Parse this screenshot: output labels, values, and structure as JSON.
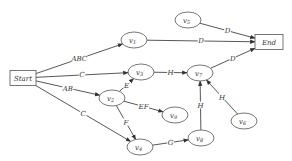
{
  "diagram": {
    "type": "directed-graph",
    "colors": {
      "stroke": "#444444",
      "fill": "#ffffff",
      "text": "#333333"
    },
    "nodes": [
      {
        "id": "start",
        "label": "Start",
        "shape": "rect",
        "x": 23,
        "y": 78,
        "w": 26,
        "h": 15
      },
      {
        "id": "end",
        "label": "End",
        "shape": "rect",
        "x": 269,
        "y": 42,
        "w": 28,
        "h": 15
      },
      {
        "id": "v1",
        "label": "v",
        "sub": "1",
        "shape": "ellipse",
        "x": 134,
        "y": 40
      },
      {
        "id": "v2",
        "label": "v",
        "sub": "2",
        "shape": "ellipse",
        "x": 112,
        "y": 98
      },
      {
        "id": "v3",
        "label": "v",
        "sub": "3",
        "shape": "ellipse",
        "x": 141,
        "y": 72
      },
      {
        "id": "v4",
        "label": "v",
        "sub": "4",
        "shape": "ellipse",
        "x": 140,
        "y": 147
      },
      {
        "id": "v5",
        "label": "v",
        "sub": "5",
        "shape": "ellipse",
        "x": 188,
        "y": 20
      },
      {
        "id": "v6",
        "label": "v",
        "sub": "6",
        "shape": "ellipse",
        "x": 244,
        "y": 121
      },
      {
        "id": "v7",
        "label": "v",
        "sub": "7",
        "shape": "ellipse",
        "x": 200,
        "y": 73
      },
      {
        "id": "v8",
        "label": "v",
        "sub": "8",
        "shape": "ellipse",
        "x": 201,
        "y": 138
      },
      {
        "id": "v9",
        "label": "v",
        "sub": "9",
        "shape": "ellipse",
        "x": 175,
        "y": 115
      }
    ],
    "edges": [
      {
        "from": "start",
        "to": "v1",
        "label": "ABC"
      },
      {
        "from": "start",
        "to": "v3",
        "label": "C"
      },
      {
        "from": "start",
        "to": "v2",
        "label": "AB"
      },
      {
        "from": "start",
        "to": "v4",
        "label": "C"
      },
      {
        "from": "v1",
        "to": "end",
        "label": "D"
      },
      {
        "from": "v5",
        "to": "end",
        "label": "D"
      },
      {
        "from": "v7",
        "to": "end",
        "label": "D"
      },
      {
        "from": "v3",
        "to": "v7",
        "label": "H"
      },
      {
        "from": "v2",
        "to": "v3",
        "label": "E"
      },
      {
        "from": "v2",
        "to": "v9",
        "label": "EF"
      },
      {
        "from": "v2",
        "to": "v4",
        "label": "F"
      },
      {
        "from": "v4",
        "to": "v8",
        "label": "G"
      },
      {
        "from": "v8",
        "to": "v7",
        "label": "H"
      },
      {
        "from": "v6",
        "to": "v7",
        "label": "H"
      }
    ]
  }
}
